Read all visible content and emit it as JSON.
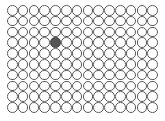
{
  "grid": {
    "columns": 14,
    "rows": 10,
    "pitch_px": 10.8,
    "filled_cells": [
      {
        "row": 3,
        "col": 4
      }
    ],
    "colors": {
      "stroke": "#5a5a5a",
      "fill_empty": "#ffffff",
      "fill_filled": "#555555"
    }
  }
}
